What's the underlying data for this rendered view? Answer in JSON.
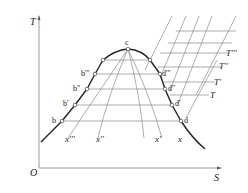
{
  "diagram": {
    "type": "T-S diagram (temperature-entropy) with saturation dome",
    "axes": {
      "y_label": "T",
      "x_label": "S",
      "origin_label": "O"
    },
    "critical_point": {
      "label": "c"
    },
    "saturated_liquid_points": [
      "b",
      "b'",
      "b''",
      "b'''"
    ],
    "saturated_vapor_points": [
      "d",
      "d'",
      "d''",
      "d'''"
    ],
    "quality_lines": [
      "x'''",
      "x''",
      "x'",
      "x"
    ],
    "isotherm_labels": [
      "T",
      "T'",
      "T''",
      "T'''"
    ],
    "colors": {
      "curve": "#222222",
      "grid": "#8a8a8a",
      "axis": "#9a9a9a",
      "text": "#222222"
    }
  }
}
